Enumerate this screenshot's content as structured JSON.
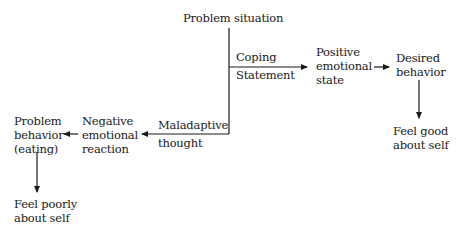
{
  "diagram": {
    "nodes": {
      "problem_situation": "Problem situation",
      "coping_statement_1": "Coping",
      "coping_statement_2": "Statement",
      "positive_1": "Positive",
      "positive_2": "emotional",
      "positive_3": "state",
      "desired_1": "Desired",
      "desired_2": "behavior",
      "feel_good_1": "Feel good",
      "feel_good_2": "about self",
      "maladaptive_1": "Maladaptive",
      "maladaptive_2": "thought",
      "negative_1": "Negative",
      "negative_2": "emotional",
      "negative_3": "reaction",
      "problem_behavior_1": "Problem",
      "problem_behavior_2": "behavior",
      "problem_behavior_3": "(eating)",
      "feel_poorly_1": "Feel poorly",
      "feel_poorly_2": "about self"
    },
    "colors": {
      "line": "#1a1a1a",
      "background": "#ffffff"
    }
  }
}
